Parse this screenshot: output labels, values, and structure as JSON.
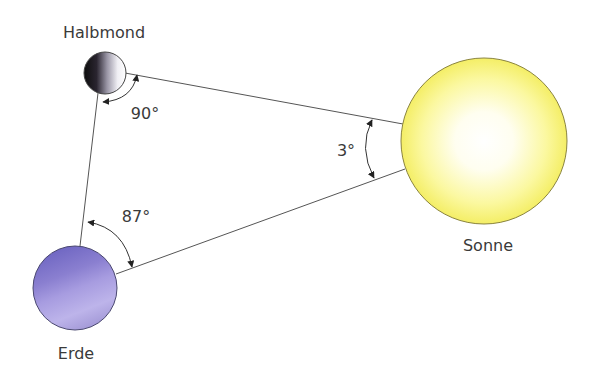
{
  "diagram": {
    "bodies": {
      "moon": {
        "label": "Halbmond",
        "color": "#1a1a1a"
      },
      "earth": {
        "label": "Erde",
        "color": "#8a82d2"
      },
      "sun": {
        "label": "Sonne",
        "color": "#f6f068"
      }
    },
    "angles": {
      "moon": "90°",
      "earth": "87°",
      "sun": "3°"
    }
  }
}
